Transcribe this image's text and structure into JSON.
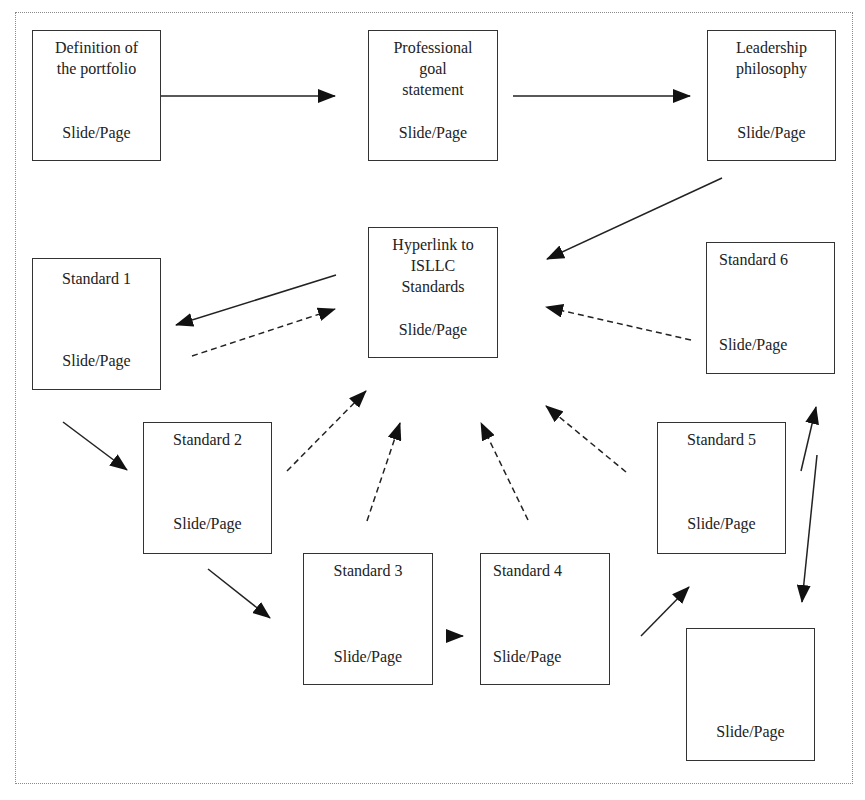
{
  "diagram": {
    "nodes": [
      {
        "id": "definition",
        "title": "Definition of\nthe portfolio",
        "sub": "Slide/Page"
      },
      {
        "id": "goal",
        "title": "Professional\ngoal\nstatement",
        "sub": "Slide/Page"
      },
      {
        "id": "leadership",
        "title": "Leadership\nphilosophy",
        "sub": "Slide/Page"
      },
      {
        "id": "hyperlink",
        "title": "Hyperlink to\nISLLC\nStandards",
        "sub": "Slide/Page"
      },
      {
        "id": "standard1",
        "title": "Standard 1",
        "sub": "Slide/Page"
      },
      {
        "id": "standard2",
        "title": "Standard 2",
        "sub": "Slide/Page"
      },
      {
        "id": "standard3",
        "title": "Standard 3",
        "sub": "Slide/Page"
      },
      {
        "id": "standard4",
        "title": "Standard 4",
        "sub": "Slide/Page"
      },
      {
        "id": "standard5",
        "title": "Standard 5",
        "sub": "Slide/Page"
      },
      {
        "id": "standard6",
        "title": "Standard 6",
        "sub": "Slide/Page"
      },
      {
        "id": "final",
        "title": "",
        "sub": "Slide/Page"
      }
    ],
    "edges": [
      {
        "from": "definition",
        "to": "goal",
        "style": "solid"
      },
      {
        "from": "goal",
        "to": "leadership",
        "style": "solid"
      },
      {
        "from": "leadership",
        "to": "hyperlink",
        "style": "solid"
      },
      {
        "from": "hyperlink",
        "to": "standard1",
        "style": "solid"
      },
      {
        "from": "standard1",
        "to": "hyperlink",
        "style": "dashed"
      },
      {
        "from": "standard1",
        "to": "standard2",
        "style": "solid"
      },
      {
        "from": "standard2",
        "to": "hyperlink",
        "style": "dashed"
      },
      {
        "from": "standard2",
        "to": "standard3",
        "style": "solid"
      },
      {
        "from": "standard3",
        "to": "hyperlink",
        "style": "dashed"
      },
      {
        "from": "standard3",
        "to": "standard4",
        "style": "solid"
      },
      {
        "from": "standard4",
        "to": "hyperlink",
        "style": "dashed"
      },
      {
        "from": "standard4",
        "to": "standard5",
        "style": "solid"
      },
      {
        "from": "standard5",
        "to": "hyperlink",
        "style": "dashed"
      },
      {
        "from": "standard5",
        "to": "standard6",
        "style": "solid"
      },
      {
        "from": "standard6",
        "to": "hyperlink",
        "style": "dashed"
      },
      {
        "from": "standard6",
        "to": "final",
        "style": "solid"
      }
    ],
    "colors": {
      "stroke": "#222222",
      "frame": "#8a8a8a",
      "background": "#ffffff"
    }
  }
}
